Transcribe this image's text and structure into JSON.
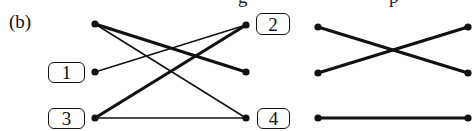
{
  "figure": {
    "label": "(b)",
    "cut_off_text": [
      {
        "text": "g",
        "x": 238
      },
      {
        "text": "p",
        "x": 389
      }
    ]
  },
  "left_graph": {
    "nodes": [
      {
        "id": "top-left",
        "x": 95,
        "y": 24,
        "label": ""
      },
      {
        "id": "1",
        "x": 95,
        "y": 72,
        "label": "1"
      },
      {
        "id": "3",
        "x": 95,
        "y": 118,
        "label": "3"
      },
      {
        "id": "2",
        "x": 246,
        "y": 25,
        "label": "2"
      },
      {
        "id": "mid-right",
        "x": 246,
        "y": 72,
        "label": ""
      },
      {
        "id": "4",
        "x": 246,
        "y": 118,
        "label": "4"
      }
    ],
    "edges": [
      {
        "from": "top-left",
        "to": "mid-right",
        "weight": "thick"
      },
      {
        "from": "top-left",
        "to": "4",
        "weight": "thin"
      },
      {
        "from": "1",
        "to": "2",
        "weight": "thin"
      },
      {
        "from": "3",
        "to": "2",
        "weight": "thick"
      },
      {
        "from": "3",
        "to": "4",
        "weight": "thin"
      }
    ],
    "boxes": [
      {
        "label": "1",
        "x": 48,
        "y": 62,
        "w": 37,
        "h": 21
      },
      {
        "label": "3",
        "x": 48,
        "y": 108,
        "w": 37,
        "h": 21
      },
      {
        "label": "2",
        "x": 256,
        "y": 13,
        "w": 34,
        "h": 22
      },
      {
        "label": "4",
        "x": 257,
        "y": 108,
        "w": 33,
        "h": 21
      }
    ]
  },
  "right_graph": {
    "edges": [
      {
        "x1": 318,
        "y1": 27,
        "x2": 468,
        "y2": 73,
        "weight": "thick"
      },
      {
        "x1": 318,
        "y1": 73,
        "x2": 468,
        "y2": 27,
        "weight": "thick"
      },
      {
        "x1": 318,
        "y1": 118,
        "x2": 468,
        "y2": 118,
        "weight": "thick"
      }
    ]
  },
  "colors": {
    "line": "#111111",
    "background": "#ffffff"
  }
}
